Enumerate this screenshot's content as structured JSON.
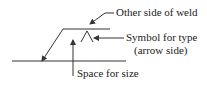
{
  "diagram": {
    "labels": {
      "other_side": "Other side of weld",
      "symbol_type_line1": "Symbol for type",
      "symbol_type_line2": "(arrow side)",
      "space_size": "Space for size"
    },
    "colors": {
      "stroke": "#333333",
      "text": "#1a1a1a"
    }
  }
}
